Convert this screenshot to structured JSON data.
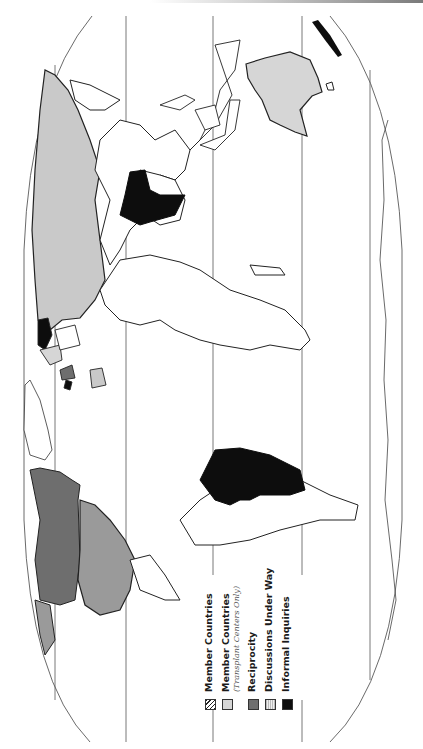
{
  "figure": {
    "type": "world-map",
    "orientation": "rotated-90-counterclockwise",
    "projection_outline": "oval"
  },
  "legend": {
    "items": [
      {
        "label": "Member Countries",
        "sublabel": "",
        "fill": "stippled-dark",
        "color": "#222222"
      },
      {
        "label": "Member Countries",
        "sublabel": "(Transplant Centers Only)",
        "fill": "light-gray",
        "color": "#d6d6d6"
      },
      {
        "label": "Reciprocity",
        "sublabel": "",
        "fill": "medium-gray",
        "color": "#6e6e6e"
      },
      {
        "label": "Discussions Under Way",
        "sublabel": "",
        "fill": "fine-stipple",
        "color": "#bbbbbb"
      },
      {
        "label": "Informal Inquiries",
        "sublabel": "",
        "fill": "black",
        "color": "#0d0d0d"
      }
    ]
  },
  "regions": {
    "member_countries": [
      "United States",
      "Mexico (partial)"
    ],
    "member_transplant_only": [
      "Australia",
      "Europe (partial)"
    ],
    "reciprocity": [
      "Canada",
      "Western Europe (partial)"
    ],
    "discussions_under_way": [
      "Russia / USSR",
      "Scandinavia"
    ],
    "informal_inquiries": [
      "Brazil",
      "India",
      "Japan",
      "Spain/Portugal area"
    ]
  },
  "colors": {
    "outline": "#222222",
    "grid": "#555555",
    "background": "#ffffff"
  }
}
